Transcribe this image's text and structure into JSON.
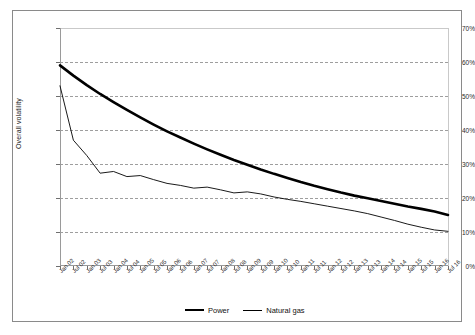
{
  "chart_data": {
    "type": "line",
    "title": "",
    "xlabel": "",
    "ylabel": "Overall volatility",
    "ylim": [
      0,
      70
    ],
    "ytick_labels": [
      "70%",
      "60%",
      "50%",
      "40%",
      "30%",
      "20%",
      "10%",
      "0%"
    ],
    "ytick_values": [
      70,
      60,
      50,
      40,
      30,
      20,
      10,
      0
    ],
    "grid": true,
    "legend_position": "bottom",
    "categories": [
      "Jan 02",
      "Jul 02",
      "Jan 03",
      "Jul 03",
      "Jan 04",
      "Jul 04",
      "Jan 05",
      "Jul 05",
      "Jan 06",
      "Jul 06",
      "Jan 07",
      "Jul 07",
      "Jan 08",
      "Jul 08",
      "Jan 09",
      "Jul 09",
      "Jan 10",
      "Jul 10",
      "Jan 11",
      "Jul 11",
      "Jan 12",
      "Jul 12",
      "Jan 13",
      "Jul 13",
      "Jan 14",
      "Jul 14",
      "Jan 15",
      "Jul 15",
      "Jan 16",
      "Jul 16"
    ],
    "series": [
      {
        "name": "Power",
        "style": "thick",
        "color": "#000000",
        "values": [
          59.0,
          56.0,
          53.2,
          50.6,
          48.2,
          45.9,
          43.7,
          41.6,
          39.6,
          37.8,
          36.0,
          34.3,
          32.7,
          31.2,
          29.8,
          28.4,
          27.1,
          25.9,
          24.7,
          23.6,
          22.6,
          21.6,
          20.7,
          19.9,
          19.1,
          18.3,
          17.5,
          16.8,
          16.0,
          15.0
        ]
      },
      {
        "name": "Natural gas",
        "style": "thin",
        "color": "#000000",
        "values": [
          53.0,
          37.0,
          32.5,
          27.3,
          27.8,
          26.3,
          26.6,
          25.4,
          24.3,
          23.7,
          22.9,
          23.2,
          22.4,
          21.5,
          21.8,
          21.2,
          20.3,
          19.6,
          19.0,
          18.3,
          17.6,
          16.9,
          16.2,
          15.4,
          14.4,
          13.4,
          12.3,
          11.4,
          10.6,
          10.2
        ]
      }
    ]
  },
  "legend": {
    "entries": [
      {
        "label": "Power"
      },
      {
        "label": "Natural gas"
      }
    ]
  }
}
